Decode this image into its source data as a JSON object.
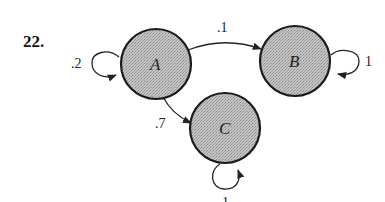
{
  "problem_number": "22.",
  "colors": {
    "node_fill": "#bdbdbd",
    "node_stroke": "#1a1a1a",
    "edge": "#222222",
    "background": "#ffffff"
  },
  "nodes": [
    {
      "id": "A",
      "label": "A"
    },
    {
      "id": "B",
      "label": "B"
    },
    {
      "id": "C",
      "label": "C"
    }
  ],
  "edges": [
    {
      "from": "A",
      "to": "A",
      "label": ".2",
      "type": "self-loop"
    },
    {
      "from": "A",
      "to": "B",
      "label": ".1",
      "type": "transition"
    },
    {
      "from": "A",
      "to": "C",
      "label": ".7",
      "type": "transition"
    },
    {
      "from": "B",
      "to": "B",
      "label": "1",
      "type": "self-loop"
    },
    {
      "from": "C",
      "to": "C",
      "label": "1",
      "type": "self-loop"
    }
  ]
}
